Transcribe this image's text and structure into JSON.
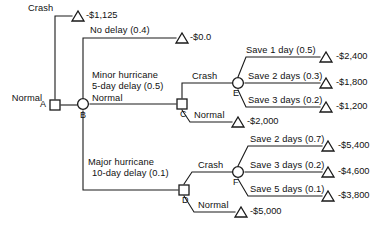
{
  "diagram": {
    "type": "decision-tree",
    "title": "",
    "nodes": [
      {
        "id": "A",
        "label": "A",
        "kind": "decision",
        "x": 55,
        "y": 105
      },
      {
        "id": "B",
        "label": "B",
        "kind": "chance",
        "x": 83,
        "y": 104
      },
      {
        "id": "C",
        "label": "C",
        "kind": "decision",
        "x": 182,
        "y": 104
      },
      {
        "id": "D",
        "label": "D",
        "kind": "decision",
        "x": 184,
        "y": 190
      },
      {
        "id": "E",
        "label": "E",
        "kind": "chance",
        "x": 238,
        "y": 83
      },
      {
        "id": "F",
        "label": "F",
        "kind": "chance",
        "x": 238,
        "y": 172
      }
    ],
    "branch_labels": {
      "crash_top": "Crash",
      "normal_a": "Normal",
      "no_delay": "No delay (0.4)",
      "minor_hurricane_line1": "Minor hurricane",
      "minor_hurricane_line2": "5-day delay (0.5)",
      "major_hurricane_line1": "Major hurricane",
      "major_hurricane_line2": "10-day delay (0.1)",
      "crash_c": "Crash",
      "normal_c": "Normal",
      "crash_d": "Crash",
      "normal_d": "Normal",
      "save_1_day": "Save 1 day (0.5)",
      "save_2_days_e": "Save 2 days (0.3)",
      "save_3_days_e": "Save 3 days (0.2)",
      "save_2_days_f": "Save 2 days (0.7)",
      "save_3_days_f": "Save 3 days (0.2)",
      "save_5_days_f": "Save 5 days (0.1)"
    },
    "payoffs": {
      "crash_top": "-$1,125",
      "no_delay": "-$0.0",
      "save_1_day": "-$2,400",
      "save_2_days_e": "-$1,800",
      "save_3_days_e": "-$1,200",
      "normal_c": "-$2,000",
      "save_2_days_f": "-$5,400",
      "save_3_days_f": "-$4,600",
      "save_5_days_f": "-$3,800",
      "normal_d": "-$5,000"
    },
    "colors": {
      "stroke": "#1a1a1a",
      "text": "#111111",
      "background": "#ffffff"
    }
  }
}
